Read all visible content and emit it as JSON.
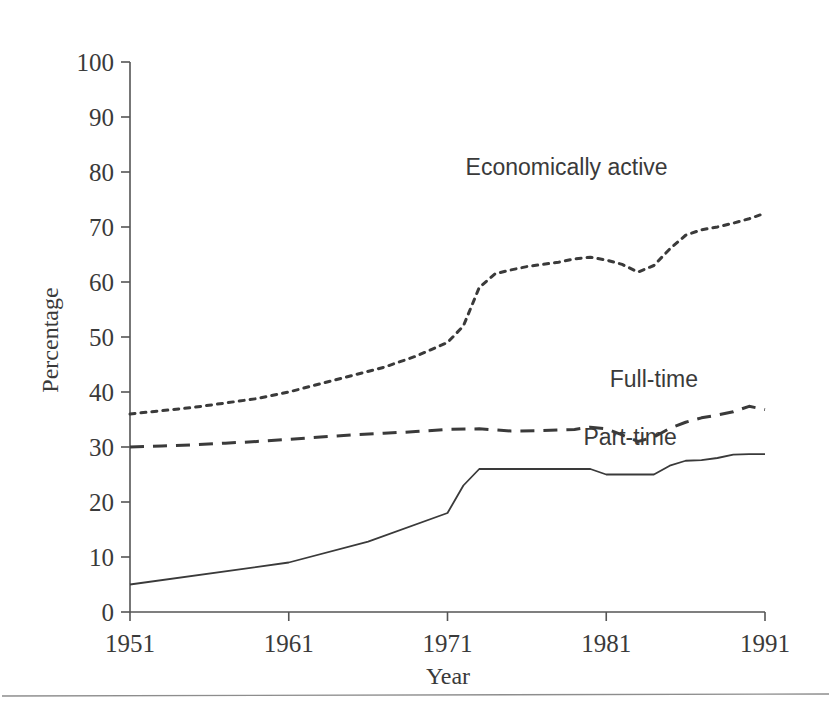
{
  "figure": {
    "background": "#ffffff",
    "ink_color": "#3a3a3a",
    "rule_color": "#8d8d8d"
  },
  "chart_data": {
    "type": "line",
    "title": "",
    "subtitle": "",
    "xlabel": "Year",
    "ylabel": "Percentage",
    "xlim": [
      1951,
      1991
    ],
    "ylim": [
      0,
      100
    ],
    "grid": false,
    "legend_position": "inline-annotations",
    "x_ticks": [
      1951,
      1961,
      1971,
      1981,
      1991
    ],
    "x_tick_labels": [
      "1951",
      "1961",
      "1971",
      "1981",
      "1991"
    ],
    "y_ticks": [
      0,
      10,
      20,
      30,
      40,
      50,
      60,
      70,
      80,
      90,
      100
    ],
    "y_tick_labels": [
      "0",
      "10",
      "20",
      "30",
      "40",
      "50",
      "60",
      "70",
      "80",
      "90",
      "100"
    ],
    "series": [
      {
        "name": "Economically active",
        "style": "dotted",
        "label_x": 1978.5,
        "label_y": 79.5,
        "x": [
          1951,
          1953,
          1955,
          1957,
          1959,
          1961,
          1963,
          1965,
          1967,
          1969,
          1971,
          1972,
          1973,
          1974,
          1975,
          1976,
          1977,
          1978,
          1979,
          1980,
          1981,
          1982,
          1983,
          1984,
          1985,
          1986,
          1987,
          1988,
          1989,
          1990,
          1991
        ],
        "values": [
          36.0,
          36.6,
          37.2,
          38.0,
          38.8,
          40.0,
          41.5,
          43.0,
          44.5,
          46.5,
          49.0,
          52.0,
          59.0,
          61.5,
          62.2,
          62.8,
          63.2,
          63.6,
          64.2,
          64.5,
          64.0,
          63.2,
          61.8,
          63.0,
          66.0,
          68.5,
          69.5,
          70.0,
          70.7,
          71.5,
          72.5
        ]
      },
      {
        "name": "Full-time",
        "style": "dashed",
        "label_x": 1984.0,
        "label_y": 41.0,
        "x": [
          1951,
          1953,
          1955,
          1957,
          1959,
          1961,
          1963,
          1965,
          1967,
          1969,
          1971,
          1973,
          1975,
          1977,
          1979,
          1980,
          1981,
          1982,
          1983,
          1984,
          1985,
          1986,
          1987,
          1988,
          1989,
          1990,
          1991
        ],
        "values": [
          30.0,
          30.2,
          30.4,
          30.7,
          31.0,
          31.4,
          31.8,
          32.2,
          32.5,
          32.8,
          33.2,
          33.3,
          32.9,
          33.0,
          33.2,
          33.6,
          33.3,
          32.2,
          31.0,
          31.8,
          33.4,
          34.5,
          35.3,
          35.8,
          36.4,
          37.4,
          36.8
        ]
      },
      {
        "name": "Part-time",
        "style": "solid",
        "label_x": 1982.5,
        "label_y": 30.3,
        "x": [
          1951,
          1961,
          1966,
          1971,
          1972,
          1973,
          1979,
          1980,
          1981,
          1982,
          1983,
          1984,
          1985,
          1986,
          1987,
          1988,
          1989,
          1990,
          1991
        ],
        "values": [
          5.0,
          9.0,
          12.8,
          18.0,
          23.0,
          26.0,
          26.0,
          26.0,
          25.0,
          25.0,
          25.0,
          25.0,
          26.6,
          27.5,
          27.6,
          28.0,
          28.6,
          28.7,
          28.7
        ]
      }
    ]
  }
}
